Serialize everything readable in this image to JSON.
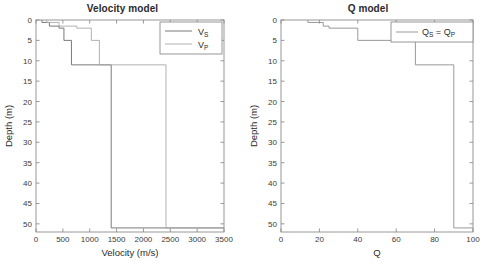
{
  "figure": {
    "background": "#ffffff",
    "axis_color": "#8d8d8d",
    "text_color": "#2b2b2b"
  },
  "chart_data": [
    {
      "type": "line",
      "title": "Velocity model",
      "xlabel": "Velocity (m/s)",
      "ylabel": "Depth (m)",
      "xlim": [
        0,
        3500
      ],
      "ylim": [
        0,
        52
      ],
      "y_inverted": true,
      "xticks": [
        0,
        500,
        1000,
        1500,
        2000,
        2500,
        3000,
        3500
      ],
      "xticklabels": [
        "0",
        "500",
        "1000",
        "1500",
        "2000",
        "2500",
        "3000",
        "3500"
      ],
      "yticks": [
        0,
        5,
        10,
        15,
        20,
        25,
        30,
        35,
        40,
        45,
        50
      ],
      "yticklabels": [
        "0",
        "5",
        "10",
        "15",
        "20",
        "25",
        "30",
        "35",
        "40",
        "45",
        "50"
      ],
      "grid": false,
      "legend_position": "upper right",
      "drawstyle": "steps",
      "layers_top": [
        0.0,
        0.6,
        1.5,
        2.0,
        5.0,
        11.0
      ],
      "layers_bottom": [
        0.6,
        1.5,
        2.0,
        5.0,
        11.0,
        51.0
      ],
      "series": [
        {
          "name": "V_S",
          "label_main": "V",
          "label_sub": "S",
          "color": "#6b6b6b",
          "values": [
            110,
            250,
            430,
            520,
            660,
            1400
          ]
        },
        {
          "name": "V_P",
          "label_main": "V",
          "label_sub": "P",
          "color": "#a9a9a9",
          "values": [
            200,
            430,
            760,
            1030,
            1180,
            2420
          ]
        }
      ]
    },
    {
      "type": "line",
      "title": "Q model",
      "xlabel": "Q",
      "ylabel": "Depth (m)",
      "xlim": [
        0,
        100
      ],
      "ylim": [
        0,
        52
      ],
      "y_inverted": true,
      "xticks": [
        0,
        20,
        40,
        60,
        80,
        100
      ],
      "xticklabels": [
        "0",
        "20",
        "40",
        "60",
        "80",
        "100"
      ],
      "yticks": [
        0,
        5,
        10,
        15,
        20,
        25,
        30,
        35,
        40,
        45,
        50
      ],
      "yticklabels": [
        "0",
        "5",
        "10",
        "15",
        "20",
        "25",
        "30",
        "35",
        "40",
        "45",
        "50"
      ],
      "grid": false,
      "legend_position": "upper right",
      "drawstyle": "steps",
      "layers_top": [
        0.0,
        0.6,
        1.5,
        2.0,
        5.0,
        11.0
      ],
      "layers_bottom": [
        0.6,
        1.5,
        2.0,
        5.0,
        11.0,
        51.0
      ],
      "series": [
        {
          "name": "Q_S = Q_P",
          "label_main": "Q",
          "label_sub": "S",
          "label_main2": "Q",
          "label_sub2": "P",
          "label_eq": " = ",
          "color": "#8d8d8d",
          "values": [
            15,
            15,
            25,
            25,
            40,
            70,
            90
          ]
        }
      ],
      "q_layers_top": [
        0.0,
        0.6,
        1.5,
        2.0,
        5.0,
        11.0
      ],
      "q_layers_bottom": [
        0.6,
        1.5,
        2.0,
        5.0,
        11.0,
        51.0
      ],
      "q_values": [
        14,
        22,
        25,
        40,
        70,
        90
      ]
    }
  ]
}
